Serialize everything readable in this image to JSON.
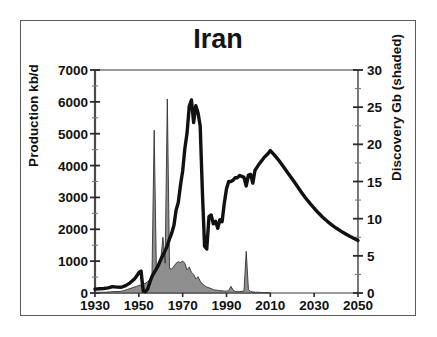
{
  "chart_data": {
    "type": "line",
    "title": "Iran",
    "xlabel": "",
    "ylabel": "Production kb/d",
    "ylabel_right": "Discovery Gb (shaded)",
    "xlim": [
      1930,
      2050
    ],
    "ylim": [
      0,
      7000
    ],
    "ylim_right": [
      0,
      30
    ],
    "grid": false,
    "legend": "none",
    "x_ticks": [
      "1930",
      "1950",
      "1970",
      "1990",
      "2010",
      "2030",
      "2050"
    ],
    "x_tick_values": [
      1930,
      1950,
      1970,
      1990,
      2010,
      2030,
      2050
    ],
    "x_minor_interval": 5,
    "y_ticks_left": [
      "0",
      "1000",
      "2000",
      "3000",
      "4000",
      "5000",
      "6000",
      "7000"
    ],
    "y_tick_values_left": [
      0,
      1000,
      2000,
      3000,
      4000,
      5000,
      6000,
      7000
    ],
    "y_minor_interval_left": 500,
    "y_ticks_right": [
      "0",
      "5",
      "10",
      "15",
      "20",
      "25",
      "30"
    ],
    "y_tick_values_right": [
      0,
      5,
      10,
      15,
      20,
      25,
      30
    ],
    "y_minor_interval_right": 2.5,
    "series": [
      {
        "name": "Production kb/d",
        "type": "line",
        "axis": "left",
        "color": "#111111",
        "linewidth": 3.4,
        "points": [
          [
            1930,
            120
          ],
          [
            1932,
            135
          ],
          [
            1934,
            140
          ],
          [
            1936,
            160
          ],
          [
            1938,
            200
          ],
          [
            1940,
            185
          ],
          [
            1942,
            180
          ],
          [
            1944,
            230
          ],
          [
            1946,
            320
          ],
          [
            1948,
            440
          ],
          [
            1949,
            530
          ],
          [
            1950,
            640
          ],
          [
            1951,
            690
          ],
          [
            1952,
            60
          ],
          [
            1953,
            40
          ],
          [
            1954,
            120
          ],
          [
            1955,
            330
          ],
          [
            1956,
            520
          ],
          [
            1957,
            640
          ],
          [
            1958,
            760
          ],
          [
            1959,
            880
          ],
          [
            1960,
            1050
          ],
          [
            1961,
            1190
          ],
          [
            1962,
            1330
          ],
          [
            1963,
            1480
          ],
          [
            1964,
            1700
          ],
          [
            1965,
            1880
          ],
          [
            1966,
            2120
          ],
          [
            1967,
            2600
          ],
          [
            1968,
            2840
          ],
          [
            1969,
            3380
          ],
          [
            1970,
            3830
          ],
          [
            1971,
            4540
          ],
          [
            1972,
            5020
          ],
          [
            1973,
            5860
          ],
          [
            1974,
            6060
          ],
          [
            1975,
            5350
          ],
          [
            1976,
            5880
          ],
          [
            1977,
            5660
          ],
          [
            1978,
            5240
          ],
          [
            1979,
            3170
          ],
          [
            1980,
            1470
          ],
          [
            1981,
            1380
          ],
          [
            1982,
            2400
          ],
          [
            1983,
            2450
          ],
          [
            1984,
            2170
          ],
          [
            1985,
            2250
          ],
          [
            1986,
            2030
          ],
          [
            1987,
            2300
          ],
          [
            1988,
            2240
          ],
          [
            1989,
            2820
          ],
          [
            1990,
            3270
          ],
          [
            1991,
            3500
          ],
          [
            1992,
            3500
          ],
          [
            1993,
            3540
          ],
          [
            1994,
            3620
          ],
          [
            1995,
            3620
          ],
          [
            1996,
            3690
          ],
          [
            1997,
            3660
          ],
          [
            1998,
            3630
          ],
          [
            1999,
            3360
          ],
          [
            2000,
            3700
          ],
          [
            2001,
            3720
          ],
          [
            2002,
            3450
          ],
          [
            2003,
            3850
          ],
          [
            2005,
            4060
          ],
          [
            2007,
            4240
          ],
          [
            2009,
            4380
          ],
          [
            2010,
            4470
          ],
          [
            2012,
            4320
          ],
          [
            2014,
            4150
          ],
          [
            2016,
            3960
          ],
          [
            2018,
            3770
          ],
          [
            2020,
            3580
          ],
          [
            2022,
            3380
          ],
          [
            2024,
            3180
          ],
          [
            2026,
            2990
          ],
          [
            2028,
            2820
          ],
          [
            2030,
            2660
          ],
          [
            2032,
            2510
          ],
          [
            2034,
            2370
          ],
          [
            2036,
            2250
          ],
          [
            2038,
            2140
          ],
          [
            2040,
            2040
          ],
          [
            2042,
            1950
          ],
          [
            2044,
            1870
          ],
          [
            2046,
            1790
          ],
          [
            2048,
            1720
          ],
          [
            2050,
            1650
          ]
        ]
      },
      {
        "name": "Discovery Gb (shaded)",
        "type": "area",
        "axis": "right",
        "color": "#8f8f8f",
        "edgecolor": "#333333",
        "values_by_year": [
          [
            1930,
            0.1
          ],
          [
            1931,
            0.1
          ],
          [
            1932,
            0.1
          ],
          [
            1933,
            0.1
          ],
          [
            1934,
            0.1
          ],
          [
            1935,
            0.1
          ],
          [
            1936,
            0.15
          ],
          [
            1937,
            0.15
          ],
          [
            1938,
            0.2
          ],
          [
            1939,
            0.2
          ],
          [
            1940,
            0.2
          ],
          [
            1941,
            0.2
          ],
          [
            1942,
            0.25
          ],
          [
            1943,
            0.3
          ],
          [
            1944,
            0.4
          ],
          [
            1945,
            0.5
          ],
          [
            1946,
            0.6
          ],
          [
            1947,
            0.7
          ],
          [
            1948,
            0.8
          ],
          [
            1949,
            0.9
          ],
          [
            1950,
            1.0
          ],
          [
            1951,
            1.1
          ],
          [
            1952,
            1.2
          ],
          [
            1953,
            1.3
          ],
          [
            1954,
            1.5
          ],
          [
            1955,
            1.8
          ],
          [
            1956,
            2.3
          ],
          [
            1957,
            21.9
          ],
          [
            1958,
            3.0
          ],
          [
            1959,
            3.6
          ],
          [
            1960,
            4.5
          ],
          [
            1961,
            7.5
          ],
          [
            1962,
            4.0
          ],
          [
            1963,
            26.1
          ],
          [
            1964,
            3.3
          ],
          [
            1965,
            3.2
          ],
          [
            1966,
            3.6
          ],
          [
            1967,
            4.0
          ],
          [
            1968,
            4.2
          ],
          [
            1969,
            4.1
          ],
          [
            1970,
            4.3
          ],
          [
            1971,
            4.0
          ],
          [
            1972,
            3.1
          ],
          [
            1973,
            3.5
          ],
          [
            1974,
            2.8
          ],
          [
            1975,
            2.5
          ],
          [
            1976,
            1.9
          ],
          [
            1977,
            2.2
          ],
          [
            1978,
            1.6
          ],
          [
            1979,
            1.2
          ],
          [
            1980,
            1.0
          ],
          [
            1981,
            0.8
          ],
          [
            1982,
            0.7
          ],
          [
            1983,
            0.6
          ],
          [
            1984,
            0.45
          ],
          [
            1985,
            0.4
          ],
          [
            1986,
            0.35
          ],
          [
            1987,
            0.3
          ],
          [
            1988,
            0.3
          ],
          [
            1989,
            0.25
          ],
          [
            1990,
            0.25
          ],
          [
            1991,
            0.3
          ],
          [
            1992,
            0.9
          ],
          [
            1993,
            0.4
          ],
          [
            1994,
            0.2
          ],
          [
            1995,
            0.2
          ],
          [
            1996,
            0.2
          ],
          [
            1997,
            0.2
          ],
          [
            1998,
            0.3
          ],
          [
            1999,
            5.6
          ],
          [
            2000,
            0.5
          ],
          [
            2001,
            0.2
          ],
          [
            2002,
            0.15
          ],
          [
            2003,
            0.1
          ],
          [
            2004,
            0.1
          ],
          [
            2005,
            0.1
          ],
          [
            2006,
            0.05
          ],
          [
            2007,
            0.05
          ],
          [
            2008,
            0.05
          ],
          [
            2009,
            0.05
          ],
          [
            2010,
            0.0
          ]
        ]
      }
    ]
  },
  "axes": {
    "left_title": "Production kb/d",
    "right_title": "Discovery Gb (shaded)"
  }
}
